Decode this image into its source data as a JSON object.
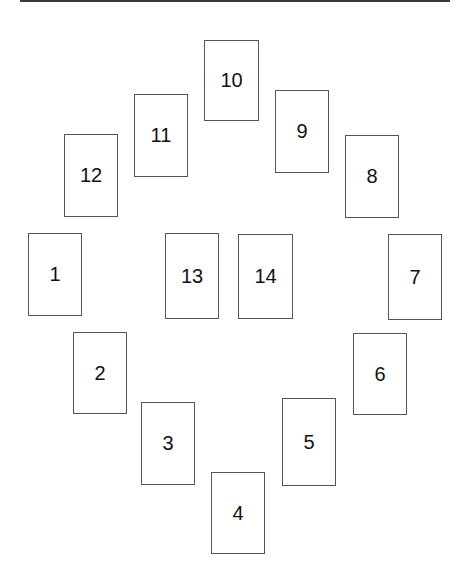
{
  "diagram": {
    "title": "",
    "cards": [
      {
        "label": "1",
        "x": 28,
        "y": 233,
        "w": 54,
        "h": 83
      },
      {
        "label": "2",
        "x": 73,
        "y": 332,
        "w": 54,
        "h": 82
      },
      {
        "label": "3",
        "x": 141,
        "y": 402,
        "w": 54,
        "h": 83
      },
      {
        "label": "4",
        "x": 211,
        "y": 472,
        "w": 54,
        "h": 82
      },
      {
        "label": "5",
        "x": 282,
        "y": 398,
        "w": 54,
        "h": 88
      },
      {
        "label": "6",
        "x": 353,
        "y": 333,
        "w": 54,
        "h": 82
      },
      {
        "label": "7",
        "x": 388,
        "y": 234,
        "w": 54,
        "h": 86
      },
      {
        "label": "8",
        "x": 345,
        "y": 135,
        "w": 54,
        "h": 83
      },
      {
        "label": "9",
        "x": 275,
        "y": 90,
        "w": 54,
        "h": 83
      },
      {
        "label": "10",
        "x": 204,
        "y": 40,
        "w": 55,
        "h": 81
      },
      {
        "label": "11",
        "x": 134,
        "y": 94,
        "w": 54,
        "h": 83
      },
      {
        "label": "12",
        "x": 64,
        "y": 134,
        "w": 54,
        "h": 83
      },
      {
        "label": "13",
        "x": 165,
        "y": 233,
        "w": 54,
        "h": 86
      },
      {
        "label": "14",
        "x": 238,
        "y": 234,
        "w": 55,
        "h": 85
      }
    ]
  }
}
